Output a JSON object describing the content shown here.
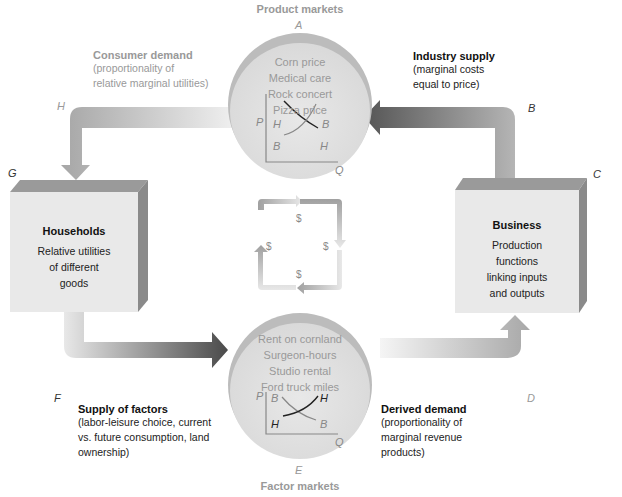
{
  "product_markets": {
    "title": "Product markets",
    "letter": "A",
    "items": [
      "Corn price",
      "Medical care",
      "Rock concert",
      "Pizza price"
    ],
    "graph": {
      "y_axis": "P",
      "x_axis": "Q",
      "curve_labels": {
        "top_left": "H",
        "top_right": "B",
        "bottom_left": "B",
        "bottom_right": "H"
      }
    }
  },
  "factor_markets": {
    "title": "Factor markets",
    "letter": "E",
    "items": [
      "Rent on cornland",
      "Surgeon-hours",
      "Studio rental",
      "Ford truck miles"
    ],
    "graph": {
      "y_axis": "P",
      "x_axis": "Q",
      "curve_labels": {
        "top_left": "B",
        "top_right": "H",
        "bottom_left": "H",
        "bottom_right": "B"
      }
    }
  },
  "households": {
    "title": "Households",
    "letter": "G",
    "lines": [
      "Relative utilities",
      "of different",
      "goods"
    ]
  },
  "business": {
    "title": "Business",
    "letter": "C",
    "lines": [
      "Production",
      "functions",
      "linking inputs",
      "and outputs"
    ]
  },
  "consumer_demand": {
    "title": "Consumer demand",
    "letter": "H",
    "lines": [
      "(proportionality of",
      "relative marginal utilities)"
    ]
  },
  "industry_supply": {
    "title": "Industry supply",
    "letter": "B",
    "lines": [
      "(marginal costs",
      "equal to price)"
    ]
  },
  "supply_of_factors": {
    "title": "Supply of factors",
    "letter": "F",
    "lines": [
      "(labor-leisure choice, current",
      "vs. future consumption, land",
      "ownership)"
    ]
  },
  "derived_demand": {
    "title": "Derived demand",
    "letter": "D",
    "lines": [
      "(proportionality of",
      "marginal revenue",
      "products)"
    ]
  },
  "money_flow": {
    "symbols": [
      "$",
      "$",
      "$",
      "$"
    ]
  }
}
